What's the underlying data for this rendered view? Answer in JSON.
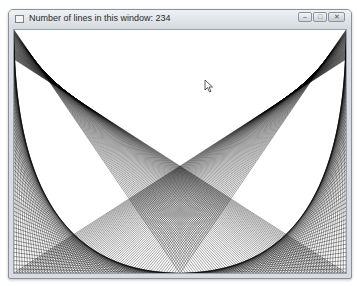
{
  "window": {
    "title": "Number of lines in this window: 234",
    "controls": {
      "minimize_icon": "minimize-icon",
      "maximize_icon": "maximize-icon",
      "close_icon": "close-icon"
    }
  },
  "canvas": {
    "line_count": 234,
    "line_color": "#000000",
    "background": "#ffffff",
    "pattern": "X-shaped line fans from top corners to bottom edge with curved side envelopes"
  },
  "cursor": {
    "icon": "mouse-pointer-icon"
  }
}
